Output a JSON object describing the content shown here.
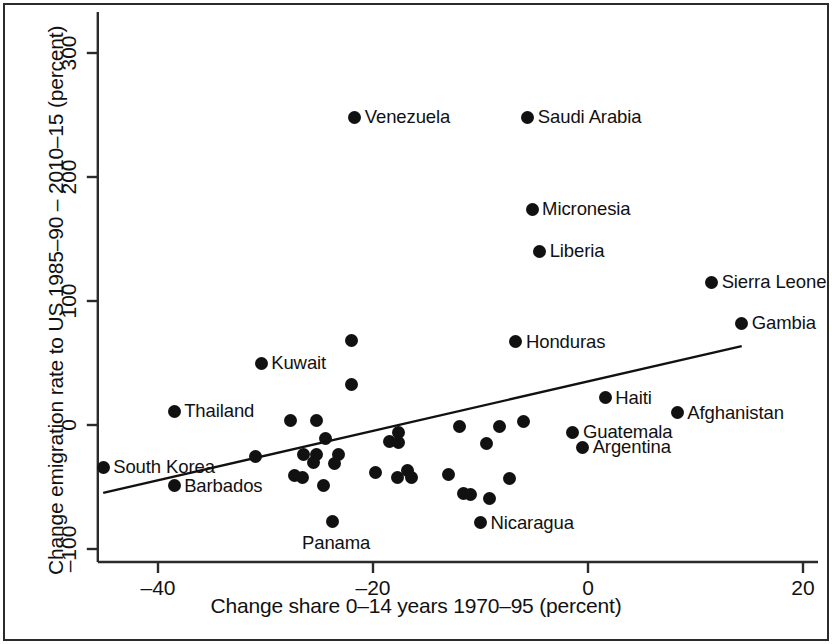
{
  "figure": {
    "x_axis_title": "Change share 0–14 years 1970–95 (percent)",
    "y_axis_title": "Change emigration rate to US 1985–90 – 2010–15 (percent)",
    "frame_color": "#2b2b2b",
    "marker_color": "#111111",
    "trendline_color": "#111111"
  },
  "chart_data": {
    "type": "scatter",
    "title": "",
    "xlabel": "Change share 0–14 years 1970–95 (percent)",
    "ylabel": "Change emigration rate to US 1985–90 – 2010–15 (percent)",
    "xlim": [
      -45.1,
      22.7
    ],
    "ylim": [
      -108.9,
      330.6
    ],
    "xticks": [
      -40,
      -20,
      0,
      20
    ],
    "xtick_labels": [
      "–40",
      "–20",
      "0",
      "20"
    ],
    "yticks": [
      -100,
      0,
      100,
      200,
      300
    ],
    "ytick_labels": [
      "–100",
      "0",
      "100",
      "200",
      "300"
    ],
    "grid": false,
    "legend": null,
    "trendline": {
      "type": "linear-fit",
      "x_start": -45.1,
      "y_start": -54.8,
      "x_end": 14.3,
      "y_end": 63.7
    },
    "labeled_points": [
      {
        "label": "Venezuela",
        "x": -21.7,
        "y": 248,
        "label_side": "right"
      },
      {
        "label": "Saudi Arabia",
        "x": -5.6,
        "y": 248,
        "label_side": "right"
      },
      {
        "label": "Micronesia",
        "x": -5.2,
        "y": 174,
        "label_side": "right"
      },
      {
        "label": "Liberia",
        "x": -4.5,
        "y": 140,
        "label_side": "right"
      },
      {
        "label": "Sierra Leone",
        "x": 11.5,
        "y": 115,
        "label_side": "right"
      },
      {
        "label": "Gambia",
        "x": 14.3,
        "y": 82,
        "label_side": "right"
      },
      {
        "label": "Honduras",
        "x": -6.7,
        "y": 67,
        "label_side": "right"
      },
      {
        "label": "Kuwait",
        "x": -30.4,
        "y": 50,
        "label_side": "right"
      },
      {
        "label": "Haiti",
        "x": 1.6,
        "y": 22,
        "label_side": "right"
      },
      {
        "label": "Thailand",
        "x": -38.5,
        "y": 11,
        "label_side": "right"
      },
      {
        "label": "Afghanistan",
        "x": 8.3,
        "y": 10,
        "label_side": "right"
      },
      {
        "label": "Guatemala",
        "x": -1.4,
        "y": -6,
        "label_side": "right"
      },
      {
        "label": "Argentina",
        "x": -0.5,
        "y": -18,
        "label_side": "right"
      },
      {
        "label": "South Korea",
        "x": -45.1,
        "y": -34,
        "label_side": "right"
      },
      {
        "label": "Barbados",
        "x": -38.5,
        "y": -49,
        "label_side": "right"
      },
      {
        "label": "Nicaragua",
        "x": -10.0,
        "y": -79,
        "label_side": "right"
      },
      {
        "label": "Panama",
        "x": -23.8,
        "y": -78,
        "label_side": "below"
      }
    ],
    "unlabeled_points": [
      {
        "x": -22.0,
        "y": 68
      },
      {
        "x": -22.0,
        "y": 33
      },
      {
        "x": -27.7,
        "y": 4
      },
      {
        "x": -25.3,
        "y": 4
      },
      {
        "x": -24.4,
        "y": -11
      },
      {
        "x": -12.0,
        "y": -1
      },
      {
        "x": -8.2,
        "y": -1
      },
      {
        "x": -6.0,
        "y": 3
      },
      {
        "x": -17.6,
        "y": -6
      },
      {
        "x": -17.6,
        "y": -14
      },
      {
        "x": -18.5,
        "y": -13
      },
      {
        "x": -9.4,
        "y": -15
      },
      {
        "x": -30.9,
        "y": -25
      },
      {
        "x": -26.5,
        "y": -24
      },
      {
        "x": -25.3,
        "y": -24
      },
      {
        "x": -25.5,
        "y": -30
      },
      {
        "x": -23.2,
        "y": -24
      },
      {
        "x": -23.6,
        "y": -31
      },
      {
        "x": -27.3,
        "y": -41
      },
      {
        "x": -26.6,
        "y": -42
      },
      {
        "x": -24.6,
        "y": -49
      },
      {
        "x": -19.8,
        "y": -38
      },
      {
        "x": -17.7,
        "y": -42
      },
      {
        "x": -16.8,
        "y": -37
      },
      {
        "x": -16.4,
        "y": -42
      },
      {
        "x": -13.0,
        "y": -40
      },
      {
        "x": -11.6,
        "y": -55
      },
      {
        "x": -10.9,
        "y": -56
      },
      {
        "x": -9.2,
        "y": -59
      },
      {
        "x": -7.3,
        "y": -43
      }
    ]
  }
}
